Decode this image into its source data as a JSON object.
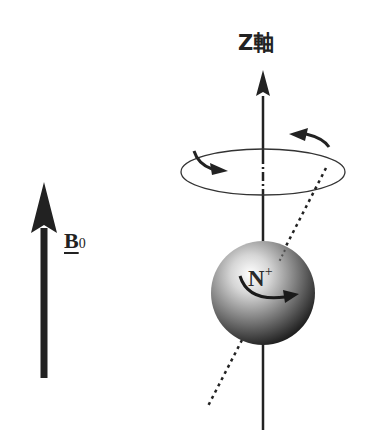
{
  "diagram": {
    "z_axis": {
      "label": "Z軸"
    },
    "field": {
      "label_main": "B",
      "label_sub": "0"
    },
    "nucleus": {
      "label_main": "N",
      "label_sup": "+"
    },
    "colors": {
      "stroke": "#222222",
      "sphere_highlight": "#ffffff",
      "sphere_mid": "#9a9a9a",
      "sphere_dark": "#1a1a1a"
    }
  }
}
